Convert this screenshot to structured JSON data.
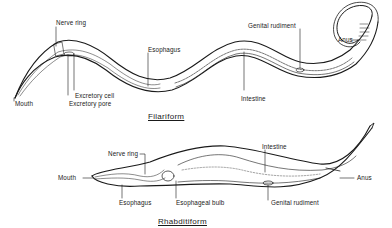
{
  "diagram": {
    "colors": {
      "ink": "#1a1a1a",
      "background": "#ffffff",
      "fill": "#eeeeee"
    }
  },
  "filariform": {
    "title": "Filariform",
    "labels": {
      "nerve_ring": "Nerve ring",
      "esophagus": "Esophagus",
      "genital_rudiment": "Genital rudiment",
      "anus": "Anus",
      "mouth": "Mouth",
      "excretory_cell": "Excretory cell",
      "excretory_pore": "Excretory pore",
      "intestine": "Intestine"
    }
  },
  "rhabditiform": {
    "title": "Rhabditiform",
    "labels": {
      "nerve_ring": "Nerve ring",
      "intestine": "Intestine",
      "mouth": "Mouth",
      "anus": "Anus",
      "esophagus": "Esophagus",
      "esophageal_bulb": "Esophageal bulb",
      "genital_rudiment": "Genital rudiment"
    }
  }
}
